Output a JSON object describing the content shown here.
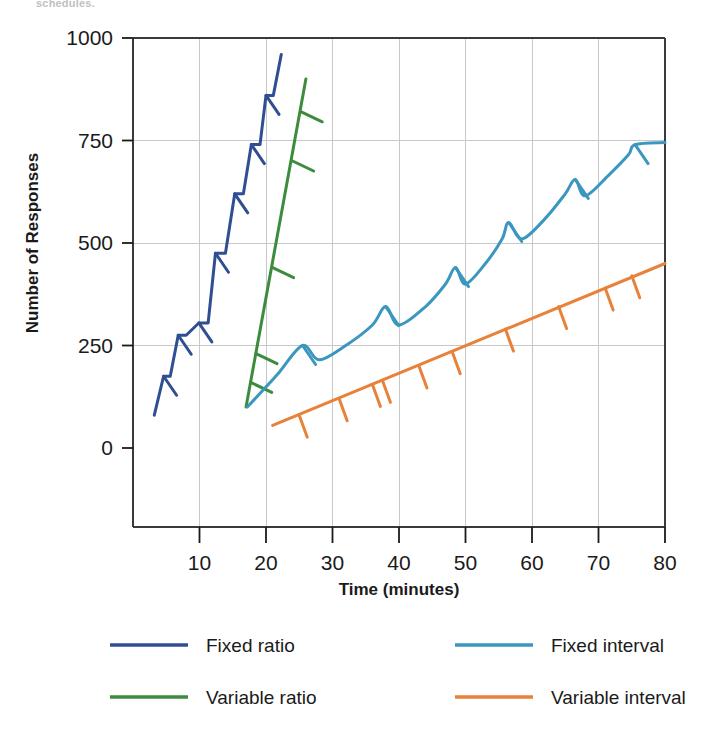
{
  "page": {
    "clipped_header_text": "schedules."
  },
  "chart_data": {
    "type": "line",
    "title": "",
    "xlabel": "Time (minutes)",
    "ylabel": "Number of Responses",
    "xlim": [
      0,
      80
    ],
    "ylim": [
      0,
      1000
    ],
    "xticks": [
      10,
      20,
      30,
      40,
      50,
      60,
      70,
      80
    ],
    "xtick_labels": [
      "10",
      "20",
      "30",
      "40",
      "50",
      "60",
      "70",
      "80"
    ],
    "yticks": [
      0,
      250,
      500,
      750,
      1000
    ],
    "ytick_labels": [
      "0",
      "250",
      "500",
      "750",
      "1000"
    ],
    "grid": "both-light",
    "legend_position": "below-axes",
    "series": [
      {
        "name": "Fixed ratio",
        "color": "#2f4f92",
        "style": "staircase",
        "description": "Steep bursts of responding separated by brief post-reinforcement pauses; reinforcement marks at the end of each run.",
        "points": [
          [
            3.2,
            80
          ],
          [
            4.6,
            175
          ],
          [
            5.6,
            175
          ],
          [
            6.8,
            275
          ],
          [
            8.0,
            275
          ],
          [
            9.9,
            305
          ],
          [
            11.3,
            305
          ],
          [
            12.4,
            475
          ],
          [
            13.9,
            475
          ],
          [
            15.3,
            620
          ],
          [
            16.6,
            620
          ],
          [
            17.8,
            740
          ],
          [
            19.1,
            740
          ],
          [
            20.0,
            860
          ],
          [
            21.1,
            860
          ],
          [
            22.3,
            960
          ]
        ],
        "reinforcement_marks": [
          [
            4.6,
            175
          ],
          [
            6.8,
            275
          ],
          [
            9.9,
            305
          ],
          [
            12.4,
            475
          ],
          [
            15.3,
            620
          ],
          [
            17.8,
            740
          ],
          [
            20.0,
            860
          ]
        ]
      },
      {
        "name": "Variable ratio",
        "color": "#3d8b3d",
        "style": "steep-straight",
        "description": "Steady very high rate of responding with no pauses; reinforcement delivered at unpredictable response numbers.",
        "points": [
          [
            17.0,
            100
          ],
          [
            26.0,
            900
          ]
        ],
        "reinforcement_marks": [
          [
            17.7,
            160
          ],
          [
            18.5,
            230
          ],
          [
            21.0,
            440
          ],
          [
            24.0,
            700
          ],
          [
            25.3,
            820
          ]
        ]
      },
      {
        "name": "Fixed interval",
        "color": "#3b96c0",
        "style": "scalloped",
        "description": "Scalloped pattern: pause after reinforcement then accelerating responding as the interval elapses.",
        "points": [
          [
            17.2,
            100
          ],
          [
            19.5,
            140
          ],
          [
            22.0,
            185
          ],
          [
            25.5,
            250
          ],
          [
            28.0,
            215
          ],
          [
            32.0,
            250
          ],
          [
            36.0,
            300
          ],
          [
            38.0,
            345
          ],
          [
            40.0,
            300
          ],
          [
            44.0,
            345
          ],
          [
            47.0,
            400
          ],
          [
            48.5,
            440
          ],
          [
            50.0,
            400
          ],
          [
            53.0,
            450
          ],
          [
            55.5,
            510
          ],
          [
            56.5,
            550
          ],
          [
            58.5,
            510
          ],
          [
            62.0,
            560
          ],
          [
            65.0,
            620
          ],
          [
            66.5,
            655
          ],
          [
            68.0,
            615
          ],
          [
            71.5,
            665
          ],
          [
            74.5,
            715
          ],
          [
            75.5,
            740
          ],
          [
            80.0,
            745
          ]
        ],
        "reinforcement_marks": [
          [
            25.5,
            250
          ],
          [
            38.0,
            345
          ],
          [
            48.5,
            440
          ],
          [
            56.5,
            550
          ],
          [
            66.5,
            655
          ],
          [
            75.5,
            740
          ]
        ]
      },
      {
        "name": "Variable interval",
        "color": "#e8813a",
        "style": "steady-straight",
        "description": "Slow, steady, constant rate of responding; reinforcement at unpredictable time intervals.",
        "points": [
          [
            21.0,
            55
          ],
          [
            80.0,
            450
          ]
        ],
        "reinforcement_marks": [
          [
            25.0,
            80
          ],
          [
            31.0,
            120
          ],
          [
            36.0,
            155
          ],
          [
            37.5,
            165
          ],
          [
            43.0,
            200
          ],
          [
            48.0,
            235
          ],
          [
            56.0,
            290
          ],
          [
            64.0,
            345
          ],
          [
            71.0,
            390
          ],
          [
            75.0,
            420
          ]
        ]
      }
    ]
  },
  "legend": {
    "entries": [
      {
        "label": "Fixed ratio",
        "color": "#2f4f92"
      },
      {
        "label": "Fixed interval",
        "color": "#3b96c0"
      },
      {
        "label": "Variable ratio",
        "color": "#3d8b3d"
      },
      {
        "label": "Variable interval",
        "color": "#e8813a"
      }
    ]
  },
  "axes": {
    "y_title": "Number of Responses",
    "x_title": "Time (minutes)"
  }
}
